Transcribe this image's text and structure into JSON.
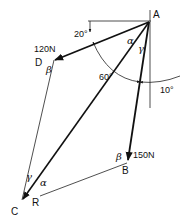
{
  "diagram": {
    "type": "force-triangle",
    "points": {
      "A": {
        "label": "A",
        "x": 149,
        "y": 22
      },
      "B": {
        "label": "B",
        "x": 127,
        "y": 163
      },
      "C": {
        "label": "C",
        "x": 22,
        "y": 200
      },
      "D": {
        "label": "D",
        "x": 54,
        "y": 60
      }
    },
    "forces": [
      {
        "name": "AD",
        "label": "120N"
      },
      {
        "name": "AB",
        "label": "150N"
      },
      {
        "name": "AC",
        "label": "R"
      }
    ],
    "angles": {
      "angle_20": "20°",
      "angle_60": "60°",
      "angle_10": "10°",
      "alpha_at_A": "α",
      "gamma_at_A": "γ",
      "beta_at_D": "β",
      "beta_at_B": "β",
      "gamma_at_C": "γ",
      "alpha_at_C": "α"
    }
  }
}
